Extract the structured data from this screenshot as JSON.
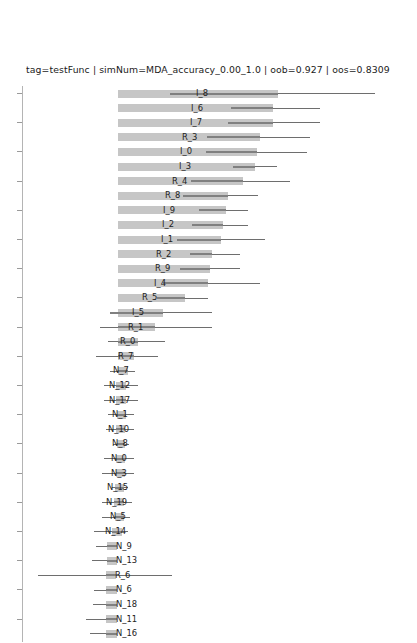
{
  "chart_data": {
    "type": "bar",
    "title": "tag=testFunc | simNum=MDA_accuracy_0.00_1.0 | oob=0.927 | oos=0.8309",
    "orientation": "horizontal",
    "xlabel": "",
    "ylabel": "",
    "grid": false,
    "legend": null,
    "tick_labels": [],
    "axis_note": "left spine with unlabeled ticks every other row",
    "meta": {
      "tag": "testFunc",
      "simNum": "MDA_accuracy_0.00_1.0",
      "oob": "0.927",
      "oos": "0.8309"
    },
    "categories": [
      "I_8",
      "I_6",
      "I_7",
      "R_3",
      "I_0",
      "I_3",
      "R_4",
      "R_8",
      "I_9",
      "I_2",
      "I_1",
      "R_2",
      "R_9",
      "I_4",
      "R_5",
      "I_5",
      "R_1",
      "R_0",
      "R_7",
      "N_7",
      "N_12",
      "N_17",
      "N_1",
      "N_10",
      "N_8",
      "N_0",
      "N_3",
      "N_15",
      "N_19",
      "N_5",
      "N_14",
      "N_9",
      "N_13",
      "R_6",
      "N_6",
      "N_18",
      "N_11",
      "N_16"
    ],
    "values": [
      160,
      147,
      147,
      132,
      131,
      124,
      122,
      111,
      108,
      104,
      99,
      94,
      91,
      85,
      72,
      57,
      48,
      32,
      28,
      16,
      14,
      13,
      12,
      11,
      10,
      9,
      9,
      8,
      7,
      6,
      14,
      11,
      11,
      11,
      11,
      11,
      11,
      11
    ],
    "bars": [
      {
        "label": "I_8",
        "bar_start": 118,
        "bar_end": 278,
        "err_start": 170,
        "err_end": 278,
        "whisk_start": 170,
        "whisk_end": 375,
        "label_x": 196
      },
      {
        "label": "I_6",
        "bar_start": 118,
        "bar_end": 273,
        "err_start": 231,
        "err_end": 273,
        "whisk_start": 231,
        "whisk_end": 320,
        "label_x": 191
      },
      {
        "label": "I_7",
        "bar_start": 118,
        "bar_end": 273,
        "err_start": 228,
        "err_end": 273,
        "whisk_start": 228,
        "whisk_end": 320,
        "label_x": 190
      },
      {
        "label": "R_3",
        "bar_start": 118,
        "bar_end": 260,
        "err_start": 207,
        "err_end": 260,
        "whisk_start": 207,
        "whisk_end": 310,
        "label_x": 182
      },
      {
        "label": "I_0",
        "bar_start": 118,
        "bar_end": 257,
        "err_start": 206,
        "err_end": 257,
        "whisk_start": 206,
        "whisk_end": 307,
        "label_x": 180
      },
      {
        "label": "I_3",
        "bar_start": 118,
        "bar_end": 255,
        "err_start": 233,
        "err_end": 255,
        "whisk_start": 233,
        "whisk_end": 277,
        "label_x": 179
      },
      {
        "label": "R_4",
        "bar_start": 118,
        "bar_end": 243,
        "err_start": 191,
        "err_end": 243,
        "whisk_start": 191,
        "whisk_end": 290,
        "label_x": 172
      },
      {
        "label": "R_8",
        "bar_start": 118,
        "bar_end": 228,
        "err_start": 183,
        "err_end": 228,
        "whisk_start": 183,
        "whisk_end": 258,
        "label_x": 165
      },
      {
        "label": "I_9",
        "bar_start": 118,
        "bar_end": 226,
        "err_start": 199,
        "err_end": 226,
        "whisk_start": 199,
        "whisk_end": 248,
        "label_x": 163
      },
      {
        "label": "I_2",
        "bar_start": 118,
        "bar_end": 223,
        "err_start": 192,
        "err_end": 223,
        "whisk_start": 192,
        "whisk_end": 248,
        "label_x": 162
      },
      {
        "label": "I_1",
        "bar_start": 118,
        "bar_end": 221,
        "err_start": 177,
        "err_end": 221,
        "whisk_start": 177,
        "whisk_end": 265,
        "label_x": 161
      },
      {
        "label": "R_2",
        "bar_start": 118,
        "bar_end": 212,
        "err_start": 190,
        "err_end": 212,
        "whisk_start": 190,
        "whisk_end": 240,
        "label_x": 156
      },
      {
        "label": "R_9",
        "bar_start": 118,
        "bar_end": 210,
        "err_start": 180,
        "err_end": 210,
        "whisk_start": 180,
        "whisk_end": 240,
        "label_x": 155
      },
      {
        "label": "I_4",
        "bar_start": 118,
        "bar_end": 208,
        "err_start": 163,
        "err_end": 208,
        "whisk_start": 163,
        "whisk_end": 260,
        "label_x": 154
      },
      {
        "label": "R_5",
        "bar_start": 118,
        "bar_end": 185,
        "err_start": 157,
        "err_end": 185,
        "whisk_start": 157,
        "whisk_end": 208,
        "label_x": 142
      },
      {
        "label": "I_5",
        "bar_start": 118,
        "bar_end": 163,
        "err_start": 110,
        "err_end": 163,
        "whisk_start": 110,
        "whisk_end": 212,
        "label_x": 132
      },
      {
        "label": "R_1",
        "bar_start": 118,
        "bar_end": 155,
        "err_start": 118,
        "err_end": 155,
        "whisk_start": 100,
        "whisk_end": 212,
        "label_x": 128
      },
      {
        "label": "R_0",
        "bar_start": 118,
        "bar_end": 138,
        "err_start": 118,
        "err_end": 138,
        "whisk_start": 108,
        "whisk_end": 165,
        "label_x": 120
      },
      {
        "label": "R_7",
        "bar_start": 118,
        "bar_end": 134,
        "err_start": 118,
        "err_end": 134,
        "whisk_start": 96,
        "whisk_end": 158,
        "label_x": 118
      },
      {
        "label": "N_7",
        "bar_start": 118,
        "bar_end": 128,
        "err_start": 118,
        "err_end": 128,
        "whisk_start": 110,
        "whisk_end": 135,
        "label_x": 113
      },
      {
        "label": "N_12",
        "bar_start": 116,
        "bar_end": 126,
        "err_start": 116,
        "err_end": 126,
        "whisk_start": 104,
        "whisk_end": 138,
        "label_x": 109
      },
      {
        "label": "N_17",
        "bar_start": 116,
        "bar_end": 126,
        "err_start": 116,
        "err_end": 126,
        "whisk_start": 104,
        "whisk_end": 138,
        "label_x": 109
      },
      {
        "label": "N_1",
        "bar_start": 117,
        "bar_end": 126,
        "err_start": 117,
        "err_end": 126,
        "whisk_start": 108,
        "whisk_end": 134,
        "label_x": 112
      },
      {
        "label": "N_10",
        "bar_start": 116,
        "bar_end": 125,
        "err_start": 116,
        "err_end": 125,
        "whisk_start": 106,
        "whisk_end": 134,
        "label_x": 108
      },
      {
        "label": "N_8",
        "bar_start": 117,
        "bar_end": 125,
        "err_start": 117,
        "err_end": 125,
        "whisk_start": 113,
        "whisk_end": 129,
        "label_x": 112
      },
      {
        "label": "N_0",
        "bar_start": 116,
        "bar_end": 125,
        "err_start": 116,
        "err_end": 125,
        "whisk_start": 104,
        "whisk_end": 134,
        "label_x": 111
      },
      {
        "label": "N_3",
        "bar_start": 116,
        "bar_end": 125,
        "err_start": 116,
        "err_end": 125,
        "whisk_start": 102,
        "whisk_end": 134,
        "label_x": 111
      },
      {
        "label": "N_15",
        "bar_start": 115,
        "bar_end": 124,
        "err_start": 115,
        "err_end": 124,
        "whisk_start": 112,
        "whisk_end": 128,
        "label_x": 107
      },
      {
        "label": "N_19",
        "bar_start": 114,
        "bar_end": 124,
        "err_start": 114,
        "err_end": 124,
        "whisk_start": 102,
        "whisk_end": 132,
        "label_x": 106
      },
      {
        "label": "N_5",
        "bar_start": 115,
        "bar_end": 124,
        "err_start": 115,
        "err_end": 124,
        "whisk_start": 102,
        "whisk_end": 130,
        "label_x": 110
      },
      {
        "label": "N_14",
        "bar_start": 112,
        "bar_end": 122,
        "err_start": 112,
        "err_end": 122,
        "whisk_start": 94,
        "whisk_end": 128,
        "label_x": 105
      },
      {
        "label": "N_9",
        "bar_start": 107,
        "bar_end": 117,
        "err_start": 107,
        "err_end": 117,
        "whisk_start": 96,
        "whisk_end": 117,
        "label_x": 116
      },
      {
        "label": "N_13",
        "bar_start": 107,
        "bar_end": 117,
        "err_start": 107,
        "err_end": 117,
        "whisk_start": 92,
        "whisk_end": 117,
        "label_x": 116
      },
      {
        "label": "R_6",
        "bar_start": 106,
        "bar_end": 116,
        "err_start": 106,
        "err_end": 116,
        "whisk_start": 38,
        "whisk_end": 172,
        "label_x": 115
      },
      {
        "label": "N_6",
        "bar_start": 106,
        "bar_end": 117,
        "err_start": 106,
        "err_end": 117,
        "whisk_start": 94,
        "whisk_end": 117,
        "label_x": 116
      },
      {
        "label": "N_18",
        "bar_start": 106,
        "bar_end": 117,
        "err_start": 106,
        "err_end": 117,
        "whisk_start": 93,
        "whisk_end": 117,
        "label_x": 116
      },
      {
        "label": "N_11",
        "bar_start": 106,
        "bar_end": 117,
        "err_start": 106,
        "err_end": 117,
        "whisk_start": 86,
        "whisk_end": 117,
        "label_x": 116
      },
      {
        "label": "N_16",
        "bar_start": 106,
        "bar_end": 117,
        "err_start": 106,
        "err_end": 117,
        "whisk_start": 90,
        "whisk_end": 117,
        "label_x": 116
      }
    ]
  }
}
